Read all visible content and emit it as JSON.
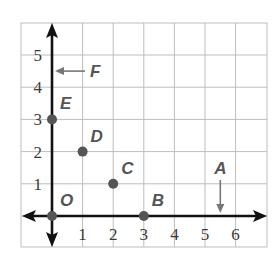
{
  "diagram": {
    "type": "coordinate-plane",
    "grid": {
      "x_min": -1,
      "x_max": 7,
      "y_min": -1,
      "y_max": 6,
      "x_ticks": [
        "1",
        "2",
        "3",
        "4",
        "5",
        "6"
      ],
      "y_ticks": [
        "1",
        "2",
        "3",
        "4",
        "5"
      ],
      "grid_color": "#bdbdbd",
      "axis_color": "#111111"
    },
    "points": [
      {
        "label": "O",
        "x": 0,
        "y": 0
      },
      {
        "label": "B",
        "x": 3,
        "y": 0
      },
      {
        "label": "C",
        "x": 2,
        "y": 1
      },
      {
        "label": "D",
        "x": 1,
        "y": 2
      },
      {
        "label": "E",
        "x": 0,
        "y": 3
      }
    ],
    "arrow_labels": [
      {
        "label": "A",
        "x": 5.5,
        "y": 0,
        "direction": "down"
      },
      {
        "label": "F",
        "x": 0,
        "y": 4.5,
        "direction": "left"
      }
    ],
    "colors": {
      "point": "#555555",
      "label": "#555555",
      "pointer_arrow": "#777777"
    }
  }
}
